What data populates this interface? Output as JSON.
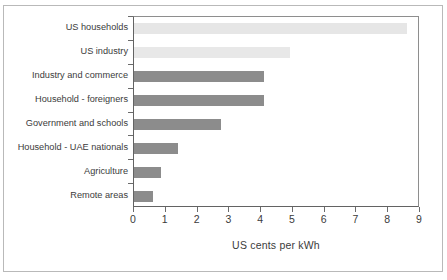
{
  "chart_data": {
    "type": "bar",
    "orientation": "horizontal",
    "title": "",
    "xlabel": "US cents per kWh",
    "ylabel": "",
    "xlim": [
      0,
      9
    ],
    "xticks": [
      0,
      1,
      2,
      3,
      4,
      5,
      6,
      7,
      8,
      9
    ],
    "xtick_labels": [
      "0",
      "1",
      "2",
      "3",
      "4",
      "5",
      "6",
      "7",
      "8",
      "9"
    ],
    "grid": false,
    "legend": false,
    "categories": [
      "US households",
      "US industry",
      "Industry and commerce",
      "Household - foreigners",
      "Government and schools",
      "Household - UAE nationals",
      "Agriculture",
      "Remote areas"
    ],
    "values": [
      8.6,
      4.9,
      4.1,
      4.1,
      2.75,
      1.4,
      0.85,
      0.6
    ],
    "bar_colors": [
      "#e6e6e6",
      "#e8e8e8",
      "#8c8c8c",
      "#8c8c8c",
      "#8c8c8c",
      "#8c8c8c",
      "#8c8c8c",
      "#8c8c8c"
    ]
  },
  "colors": {
    "reference_bar": "#e6e6e6",
    "uae_bar": "#8c8c8c",
    "axis": "#636363",
    "text": "#3b3b3b",
    "frame": "#b9b9b9",
    "background": "#ffffff"
  }
}
